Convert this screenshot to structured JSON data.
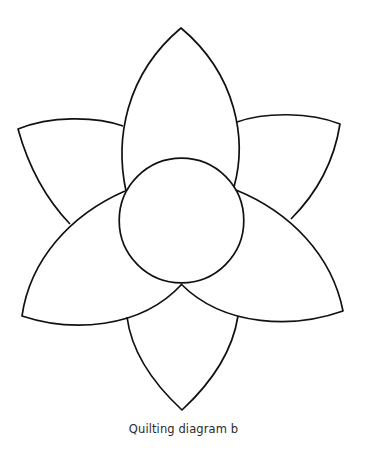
{
  "figure": {
    "caption": "Quilting diagram b",
    "stroke_color": "#111111",
    "background": "#ffffff"
  },
  "shapes": {
    "center": {
      "type": "circle",
      "label": "center-circle"
    },
    "petals": [
      {
        "label": "top-petal"
      },
      {
        "label": "upper-left-petal"
      },
      {
        "label": "upper-right-petal"
      },
      {
        "label": "lower-left-petal"
      },
      {
        "label": "lower-right-petal"
      },
      {
        "label": "bottom-petal"
      }
    ]
  }
}
